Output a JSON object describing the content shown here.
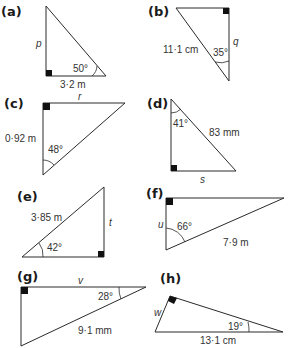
{
  "problems": [
    {
      "label": "(a)",
      "angle": "50°",
      "known_side": "3·2 m",
      "unknown": "p"
    },
    {
      "label": "(b)",
      "angle": "35°",
      "known_side": "11·1 cm",
      "unknown": "q"
    },
    {
      "label": "(c)",
      "angle": "48°",
      "known_side": "0·92 m",
      "unknown": "r"
    },
    {
      "label": "(d)",
      "angle": "41°",
      "known_side": "83 mm",
      "unknown": "s"
    },
    {
      "label": "(e)",
      "angle": "42°",
      "known_side": "3·85 m",
      "unknown": "t"
    },
    {
      "label": "(f)",
      "angle": "66°",
      "known_side": "7·9 m",
      "unknown": "u"
    },
    {
      "label": "(g)",
      "angle": "28°",
      "known_side": "9·1 mm",
      "unknown": "v"
    },
    {
      "label": "(h)",
      "angle": "19°",
      "known_side": "13·1 cm",
      "unknown": "w"
    }
  ],
  "colors": {
    "line": "#2a2a2a",
    "right_angle_marker": "#111111",
    "text": "#333333"
  }
}
